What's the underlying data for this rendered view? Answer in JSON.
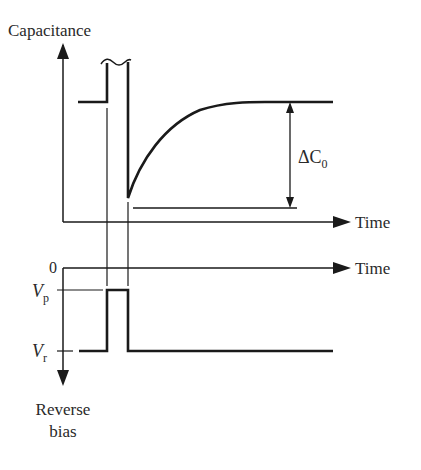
{
  "diagram": {
    "top_panel": {
      "y_axis_label": "Capacitance",
      "x_axis_label": "Time",
      "delta_label": "ΔC",
      "delta_subscript": "0"
    },
    "bottom_panel": {
      "zero_label": "0",
      "x_axis_label": "Time",
      "vp_label": "V",
      "vp_subscript": "p",
      "vr_label": "V",
      "vr_subscript": "r",
      "y_axis_label_line1": "Reverse",
      "y_axis_label_line2": "bias"
    },
    "colors": {
      "stroke": "#1a1a1a",
      "text": "#2a2a2a",
      "background": "#ffffff"
    }
  }
}
